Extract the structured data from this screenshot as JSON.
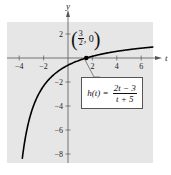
{
  "chart_data": {
    "type": "line",
    "title": "",
    "xlabel": "t",
    "ylabel": "y",
    "xlim": [
      -5,
      7
    ],
    "ylim": [
      -9,
      3
    ],
    "x_ticks": [
      -4,
      -2,
      2,
      4,
      6
    ],
    "y_ticks": [
      2,
      -2,
      -4,
      -6,
      -8
    ],
    "x_tick_labels": [
      "−4",
      "−2",
      "2",
      "4",
      "6"
    ],
    "y_tick_labels": [
      "2",
      "−2",
      "−4",
      "−6",
      "−8"
    ],
    "grid": false,
    "background_color": "#e6e6e6",
    "series": [
      {
        "name": "h(t) = (2t − 3)/(t + 5)",
        "function": "(2t-3)/(t+5)",
        "x": [
          -4.1,
          -4,
          -3.5,
          -3,
          -2,
          -1,
          0,
          1,
          1.5,
          2,
          3,
          4,
          5,
          6,
          7
        ],
        "values": [
          -12.33,
          -11,
          -6.67,
          -4.5,
          -2.33,
          -1.25,
          -0.6,
          -0.17,
          0,
          0.14,
          0.375,
          0.56,
          0.7,
          0.82,
          0.92
        ],
        "color": "#000000"
      }
    ],
    "annotations": [
      {
        "type": "point",
        "x": 1.5,
        "y": 0,
        "label": "(3/2, 0)"
      },
      {
        "type": "callout",
        "text": "h(t) = (2t − 3)/(t + 5)"
      }
    ]
  },
  "labels": {
    "x_axis": "t",
    "y_axis": "y",
    "point": {
      "open": "(",
      "num": "3",
      "den": "2",
      "rest": ", 0",
      "close": ")"
    },
    "formula": {
      "lhs": "h(t) =",
      "num": "2t − 3",
      "den": "t + 5"
    }
  }
}
